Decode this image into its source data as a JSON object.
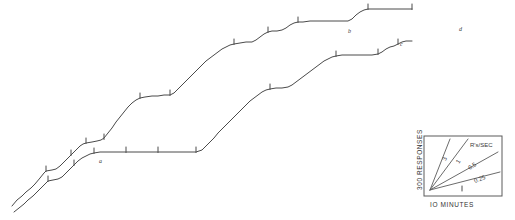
{
  "figure": {
    "kind": "cumulative-response-record",
    "background_color": "#ffffff",
    "trace_color": "#4a4a4a",
    "point_labels": [
      {
        "id": "a",
        "text": "a",
        "x": 99,
        "y": 163
      },
      {
        "id": "b",
        "text": "b",
        "x": 348,
        "y": 33
      },
      {
        "id": "c",
        "text": "c",
        "x": 400,
        "y": 46
      },
      {
        "id": "d",
        "text": "d",
        "x": 459,
        "y": 31
      }
    ]
  },
  "legend": {
    "y_axis_label": "300 RESPONSES",
    "x_axis_label": "IO MINUTES",
    "rate_unit_label": "R's/SEC",
    "rate_labels": [
      "3",
      "1",
      "0.5",
      "0.25"
    ],
    "box": {
      "x": 424,
      "y": 136,
      "width": 78,
      "height": 60
    }
  },
  "chart_data": {
    "type": "line",
    "title": "",
    "xlabel": "IO MINUTES",
    "ylabel": "300 RESPONSES",
    "grid": false,
    "legend_position": "bottom-right-inset",
    "axis_note": "Axes are calibration bars only; no numeric tick labels on the record itself.",
    "calibration": {
      "x_unit": "10 minutes",
      "y_unit": "300 responses",
      "rates_responses_per_sec": [
        3,
        1,
        0.5,
        0.25
      ]
    },
    "series": [
      {
        "name": "upper-record",
        "comment": "Upper cumulative curve; scalloped staircase rising left to right, pen resets omitted.",
        "points": [
          [
            12,
            206
          ],
          [
            17,
            200
          ],
          [
            22,
            196
          ],
          [
            26,
            192
          ],
          [
            31,
            188
          ],
          [
            35,
            184
          ],
          [
            40,
            178
          ],
          [
            44,
            173
          ],
          [
            46,
            171
          ],
          [
            52,
            170
          ],
          [
            56,
            169
          ],
          [
            60,
            166
          ],
          [
            64,
            162
          ],
          [
            68,
            158
          ],
          [
            71,
            155
          ],
          [
            74,
            152
          ],
          [
            77,
            149
          ],
          [
            80,
            146
          ],
          [
            83,
            144
          ],
          [
            86,
            143
          ],
          [
            92,
            142
          ],
          [
            97,
            141
          ],
          [
            101,
            140
          ],
          [
            104,
            138
          ],
          [
            108,
            133
          ],
          [
            112,
            128
          ],
          [
            116,
            122
          ],
          [
            120,
            117
          ],
          [
            124,
            112
          ],
          [
            128,
            107
          ],
          [
            132,
            103
          ],
          [
            136,
            100
          ],
          [
            140,
            98
          ],
          [
            145,
            97
          ],
          [
            152,
            96
          ],
          [
            158,
            96
          ],
          [
            164,
            95
          ],
          [
            170,
            95
          ],
          [
            174,
            93
          ],
          [
            178,
            89
          ],
          [
            182,
            85
          ],
          [
            186,
            81
          ],
          [
            190,
            77
          ],
          [
            194,
            73
          ],
          [
            198,
            69
          ],
          [
            202,
            65
          ],
          [
            206,
            61
          ],
          [
            210,
            58
          ],
          [
            214,
            55
          ],
          [
            218,
            52
          ],
          [
            222,
            49
          ],
          [
            226,
            47
          ],
          [
            230,
            45
          ],
          [
            234,
            44
          ],
          [
            240,
            43
          ],
          [
            246,
            42
          ],
          [
            252,
            42
          ],
          [
            256,
            40
          ],
          [
            260,
            37
          ],
          [
            264,
            34
          ],
          [
            268,
            32
          ],
          [
            272,
            31
          ],
          [
            277,
            31
          ],
          [
            282,
            30
          ],
          [
            286,
            28
          ],
          [
            290,
            25
          ],
          [
            294,
            23
          ],
          [
            298,
            22
          ],
          [
            303,
            22
          ],
          [
            310,
            21
          ],
          [
            318,
            21
          ],
          [
            326,
            21
          ],
          [
            334,
            21
          ],
          [
            342,
            21
          ],
          [
            348,
            21
          ],
          [
            352,
            19
          ],
          [
            356,
            15
          ],
          [
            360,
            12
          ],
          [
            364,
            10
          ],
          [
            368,
            9
          ],
          [
            374,
            9
          ],
          [
            382,
            9
          ],
          [
            390,
            9
          ],
          [
            398,
            9
          ],
          [
            406,
            9
          ],
          [
            412,
            9
          ]
        ]
      },
      {
        "name": "lower-record",
        "comment": "Lower cumulative curve offset below the upper one; same scalloped pattern.",
        "points": [
          [
            14,
            212
          ],
          [
            19,
            208
          ],
          [
            24,
            204
          ],
          [
            28,
            200
          ],
          [
            33,
            196
          ],
          [
            37,
            192
          ],
          [
            41,
            188
          ],
          [
            45,
            184
          ],
          [
            48,
            181
          ],
          [
            53,
            180
          ],
          [
            58,
            179
          ],
          [
            62,
            177
          ],
          [
            66,
            173
          ],
          [
            70,
            169
          ],
          [
            74,
            165
          ],
          [
            78,
            161
          ],
          [
            82,
            158
          ],
          [
            86,
            156
          ],
          [
            90,
            154
          ],
          [
            94,
            153
          ],
          [
            100,
            152
          ],
          [
            106,
            152
          ],
          [
            112,
            152
          ],
          [
            118,
            152
          ],
          [
            126,
            152
          ],
          [
            134,
            152
          ],
          [
            142,
            152
          ],
          [
            150,
            152
          ],
          [
            158,
            152
          ],
          [
            166,
            152
          ],
          [
            174,
            152
          ],
          [
            182,
            152
          ],
          [
            190,
            152
          ],
          [
            196,
            152
          ],
          [
            202,
            150
          ],
          [
            206,
            146
          ],
          [
            210,
            142
          ],
          [
            214,
            138
          ],
          [
            218,
            133
          ],
          [
            222,
            129
          ],
          [
            226,
            125
          ],
          [
            230,
            121
          ],
          [
            234,
            117
          ],
          [
            238,
            113
          ],
          [
            242,
            109
          ],
          [
            246,
            105
          ],
          [
            250,
            101
          ],
          [
            254,
            98
          ],
          [
            258,
            95
          ],
          [
            262,
            92
          ],
          [
            266,
            90
          ],
          [
            270,
            89
          ],
          [
            276,
            88
          ],
          [
            282,
            88
          ],
          [
            288,
            87
          ],
          [
            292,
            85
          ],
          [
            296,
            82
          ],
          [
            300,
            79
          ],
          [
            304,
            76
          ],
          [
            308,
            73
          ],
          [
            312,
            70
          ],
          [
            316,
            67
          ],
          [
            320,
            64
          ],
          [
            324,
            61
          ],
          [
            328,
            59
          ],
          [
            332,
            57
          ],
          [
            336,
            56
          ],
          [
            342,
            55
          ],
          [
            348,
            55
          ],
          [
            354,
            55
          ],
          [
            360,
            55
          ],
          [
            366,
            55
          ],
          [
            372,
            55
          ],
          [
            378,
            54
          ],
          [
            382,
            52
          ],
          [
            386,
            49
          ],
          [
            390,
            47
          ],
          [
            394,
            46
          ],
          [
            398,
            44
          ],
          [
            402,
            42
          ],
          [
            406,
            41
          ],
          [
            412,
            41
          ]
        ]
      }
    ],
    "tick_marks": [
      {
        "series": "upper-record",
        "x": 46,
        "y": 171
      },
      {
        "series": "upper-record",
        "x": 71,
        "y": 155
      },
      {
        "series": "upper-record",
        "x": 86,
        "y": 143
      },
      {
        "series": "upper-record",
        "x": 104,
        "y": 139
      },
      {
        "series": "upper-record",
        "x": 140,
        "y": 98
      },
      {
        "series": "upper-record",
        "x": 170,
        "y": 95
      },
      {
        "series": "upper-record",
        "x": 234,
        "y": 44
      },
      {
        "series": "upper-record",
        "x": 268,
        "y": 32
      },
      {
        "series": "upper-record",
        "x": 298,
        "y": 22
      },
      {
        "series": "upper-record",
        "x": 368,
        "y": 9
      },
      {
        "series": "upper-record",
        "x": 412,
        "y": 9
      },
      {
        "series": "lower-record",
        "x": 48,
        "y": 181
      },
      {
        "series": "lower-record",
        "x": 74,
        "y": 165
      },
      {
        "series": "lower-record",
        "x": 94,
        "y": 153
      },
      {
        "series": "lower-record",
        "x": 126,
        "y": 152
      },
      {
        "series": "lower-record",
        "x": 158,
        "y": 152
      },
      {
        "series": "lower-record",
        "x": 196,
        "y": 152
      },
      {
        "series": "lower-record",
        "x": 270,
        "y": 89
      },
      {
        "series": "lower-record",
        "x": 336,
        "y": 56
      },
      {
        "series": "lower-record",
        "x": 378,
        "y": 54
      },
      {
        "series": "lower-record",
        "x": 398,
        "y": 44
      }
    ]
  }
}
